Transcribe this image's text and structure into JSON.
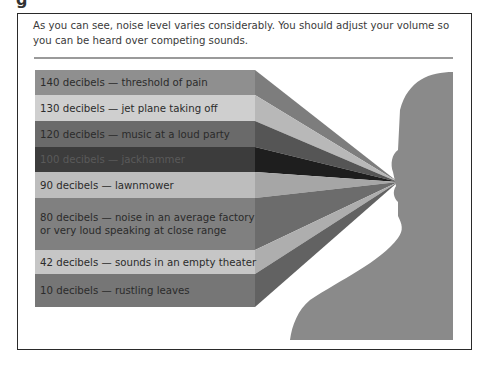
{
  "heading_fragment": "g",
  "intro_text": "As you can see, noise level varies considerably. You should adjust your volume so you can be heard over competing sounds.",
  "bands": [
    {
      "label": "140 decibels — threshold of pain",
      "color": "#8f8f8f",
      "ray": "#7d7d7d"
    },
    {
      "label": "130 decibels — jet plane taking off",
      "color": "#cfcfcf",
      "ray": "#b8b8b8"
    },
    {
      "label": "120 decibels — music at a loud party",
      "color": "#6a6a6a",
      "ray": "#555555"
    },
    {
      "label": "100 decibels — jackhammer",
      "color": "#3c3c3c",
      "ray": "#1e1e1e"
    },
    {
      "label": "90 decibels — lawnmower",
      "color": "#bdbdbd",
      "ray": "#a6a6a6"
    },
    {
      "label": "80 decibels — noise in an average factory\nor very loud speaking at close range",
      "color": "#808080",
      "ray": "#6c6c6c"
    },
    {
      "label": "42 decibels — sounds in an empty theater",
      "color": "#c6c6c6",
      "ray": "#aeaeae"
    },
    {
      "label": "10 decibels — rustling leaves",
      "color": "#767676",
      "ray": "#626262"
    }
  ],
  "head_color": "#8a8a8a"
}
